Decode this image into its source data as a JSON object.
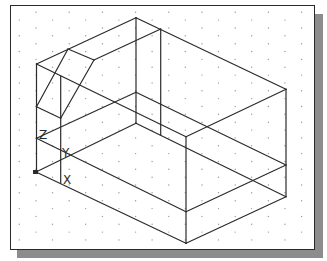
{
  "figure": {
    "frame": {
      "background": "#ffffff",
      "border": "#2a2a2a",
      "shadow": "#8c8c8c"
    },
    "grid": {
      "style": "isometric dots",
      "row_start_y": 12.3,
      "row_step": 7.85,
      "rows": 30,
      "col_step": 33.2,
      "even_row_x0": 36.0,
      "odd_row_x0": 19.3,
      "x_min": 14,
      "x_max": 311,
      "y_min": 8,
      "y_max": 246,
      "color": "#9a9a9a"
    },
    "ucs_icon": {
      "labels": [
        {
          "name": "z-axis-label",
          "text": "Z",
          "x": 39,
          "y": 139
        },
        {
          "name": "y-axis-label",
          "text": "Y",
          "x": 62,
          "y": 157
        },
        {
          "name": "x-axis-label",
          "text": "X",
          "x": 63,
          "y": 184
        }
      ],
      "origin": {
        "x": 36,
        "y": 172
      }
    },
    "edges": [
      [
        36.5,
        64,
        136,
        17.7
      ],
      [
        136,
        17.7,
        286,
        89.3
      ],
      [
        36.5,
        64,
        186,
        136.7
      ],
      [
        186,
        136.7,
        286,
        89.3
      ],
      [
        68,
        49,
        94,
        60
      ],
      [
        94,
        60,
        160.7,
        29
      ],
      [
        68,
        49,
        36.5,
        106.7
      ],
      [
        94,
        60,
        60.7,
        118.3
      ],
      [
        36.5,
        106.7,
        60.7,
        118.3
      ],
      [
        136,
        17.7,
        136,
        123.3
      ],
      [
        160.7,
        29,
        160.7,
        135
      ],
      [
        136,
        92.3,
        286,
        165
      ],
      [
        136,
        123.3,
        286,
        196.7
      ],
      [
        36.5,
        138.3,
        136,
        92.3
      ],
      [
        36,
        172,
        136,
        123.3
      ],
      [
        36.5,
        138.3,
        186,
        211.7
      ],
      [
        186,
        211.7,
        286,
        165
      ],
      [
        36,
        172,
        186,
        243.3
      ],
      [
        186,
        243.3,
        286,
        196.7
      ],
      [
        36.5,
        64,
        36.5,
        172
      ],
      [
        60.7,
        76,
        60.7,
        183
      ],
      [
        186,
        136.7,
        186,
        243.3
      ],
      [
        286,
        89.3,
        286,
        196.7
      ]
    ]
  }
}
